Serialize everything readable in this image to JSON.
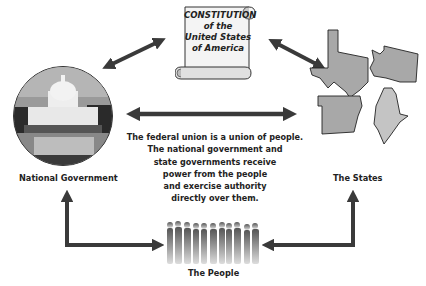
{
  "constitution": {
    "lines": [
      "CONSTITUTION",
      "of the",
      "United States",
      "of America"
    ]
  },
  "national_government": {
    "label": "National Government",
    "icon": "capitol-building-photo"
  },
  "states": {
    "label": "The States",
    "icons": [
      "texas-shape",
      "washington-shape",
      "arkansas-shape",
      "maine-shape"
    ]
  },
  "people": {
    "label": "The People",
    "icon": "crowd-silhouettes"
  },
  "description": {
    "lines": [
      "The federal union is a union of people.",
      "The national government and",
      "state governments receive",
      "power from the people",
      "and exercise authority",
      "directly over them."
    ]
  },
  "colors": {
    "arrow": "#3a3a3a",
    "state_fill": "#a8a8a8",
    "scroll_fill": "#f4f4f4",
    "text": "#222222"
  }
}
